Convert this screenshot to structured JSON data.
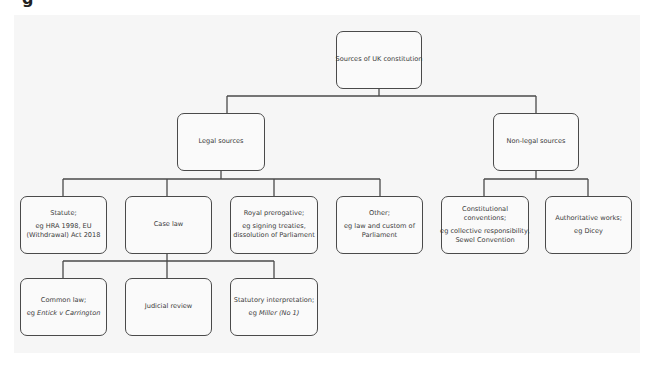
{
  "caption_fragment": "g",
  "diagram": {
    "title": "Sources of UK constitution",
    "nodes": {
      "root": {
        "lines": [
          "Sources of UK constitution"
        ]
      },
      "legal": {
        "lines": [
          "Legal sources"
        ]
      },
      "nonlegal": {
        "lines": [
          "Non-legal sources"
        ]
      },
      "statute": {
        "heading": "Statute;",
        "example_prefix": "eg HRA 1998, EU",
        "example_rest": "(Withdrawal) Act 2018"
      },
      "caselaw": {
        "lines": [
          "Case law"
        ]
      },
      "prerogative": {
        "heading": "Royal prerogative;",
        "example_prefix": "eg signing treaties,",
        "example_rest": "dissolution of Parliament"
      },
      "other": {
        "heading": "Other;",
        "example_prefix": "eg law and custom of",
        "example_rest": "Parliament"
      },
      "conventions": {
        "heading1": "Constitutional",
        "heading2": "conventions;",
        "example_prefix": "eg collective responsibility,",
        "example_rest": "Sewel Convention"
      },
      "works": {
        "heading": "Authoritative works;",
        "example_prefix": "eg Dicey"
      },
      "common": {
        "heading": "Common law;",
        "example_prefix": "eg ",
        "example_case": "Entick v Carrington"
      },
      "judicial": {
        "lines": [
          "Judicial review"
        ]
      },
      "statutory": {
        "heading": "Statutory interpretation;",
        "example_prefix": "eg ",
        "example_case": "Miller (No 1)"
      }
    },
    "edges": [
      [
        "root",
        "legal"
      ],
      [
        "root",
        "nonlegal"
      ],
      [
        "legal",
        "statute"
      ],
      [
        "legal",
        "caselaw"
      ],
      [
        "legal",
        "prerogative"
      ],
      [
        "legal",
        "other"
      ],
      [
        "nonlegal",
        "conventions"
      ],
      [
        "nonlegal",
        "works"
      ],
      [
        "caselaw",
        "common"
      ],
      [
        "caselaw",
        "judicial"
      ],
      [
        "caselaw",
        "statutory"
      ]
    ],
    "colors": {
      "panel": "#f6f6f6",
      "stroke": "#4a4a4a",
      "text": "#3a3a3a"
    }
  }
}
